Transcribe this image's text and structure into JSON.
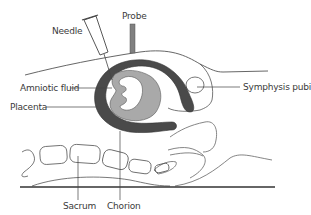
{
  "diagram": {
    "type": "anatomical-cross-section",
    "labels": {
      "needle": "Needle",
      "probe": "Probe",
      "amniotic_fluid": "Amniotic fluid",
      "placenta": "Placenta",
      "symphysis_pubis": "Symphysis pubis",
      "sacrum": "Sacrum",
      "chorion": "Chorion"
    },
    "colors": {
      "outline": "#555555",
      "placenta_chorion": "#4a4a4a",
      "fetus": "#a9a9a9",
      "probe": "#808080",
      "table": "#333333",
      "text": "#3a3a3a"
    }
  }
}
